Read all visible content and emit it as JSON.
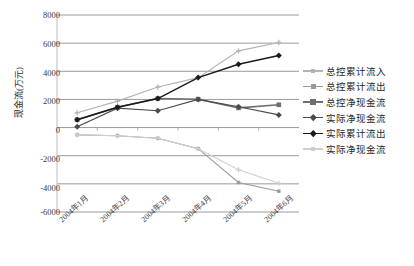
{
  "chart_data": {
    "type": "line",
    "title": "",
    "xlabel": "",
    "ylabel": "现金流(万元)",
    "categories": [
      "2004年1月",
      "2004年2月",
      "2004年3月",
      "2004年4月",
      "2004年5月",
      "2004年6月"
    ],
    "ylim": [
      -6000,
      8000
    ],
    "ytick_values": [
      8000,
      6000,
      4000,
      2000,
      0,
      -2000,
      -4000,
      -6000
    ],
    "ytick_labels": [
      "8000",
      "6000",
      "4000",
      "2000",
      "0",
      "-2000",
      "-4000",
      "-6000"
    ],
    "grid": true,
    "legend_position": "right",
    "series": [
      {
        "name": "总控累计流入",
        "color": "#b3b3b3",
        "marker": "cross",
        "values": [
          1050,
          1880,
          2880,
          3550,
          5450,
          6050
        ]
      },
      {
        "name": "总控累计流出",
        "color": "#9a9a9a",
        "marker": "square-small",
        "values": [
          -520,
          -580,
          -760,
          -1500,
          -3900,
          -4520
        ]
      },
      {
        "name": "总控净现金流",
        "color": "#6e6e6e",
        "marker": "square",
        "values": [
          560,
          1450,
          2060,
          2020,
          1400,
          1620
        ]
      },
      {
        "name": "实际净现金流",
        "color": "#4a4a4a",
        "marker": "diamond",
        "values": [
          60,
          1380,
          1200,
          2000,
          1480,
          900
        ]
      },
      {
        "name": "实际累计流出",
        "color": "#1a1a1a",
        "marker": "diamond",
        "values": [
          560,
          1450,
          2060,
          3550,
          4500,
          5120
        ]
      },
      {
        "name": "实际净现金流",
        "color": "#cfcfcf",
        "marker": "cross",
        "values": [
          -520,
          -580,
          -760,
          -1500,
          -3000,
          -3950
        ]
      }
    ]
  },
  "legend": {
    "items": [
      {
        "label": "总控累计流入"
      },
      {
        "label": "总控累计流出"
      },
      {
        "label": "总控净现金流"
      },
      {
        "label": "实际净现金流"
      },
      {
        "label": "实际累计流出"
      },
      {
        "label": "实际净现金流"
      }
    ]
  },
  "axes": {
    "y_title": "现金流(万元)",
    "y_labels": [
      "8000",
      "6000",
      "4000",
      "2000",
      "0",
      "-2000",
      "-4000",
      "-6000"
    ],
    "x_labels": [
      "2004年1月",
      "2004年2月",
      "2004年3月",
      "2004年4月",
      "2004年5月",
      "2004年6月"
    ]
  },
  "colors": {
    "grid": "#9a9a9a",
    "text": "#2b2b2b",
    "background": "#ffffff"
  }
}
